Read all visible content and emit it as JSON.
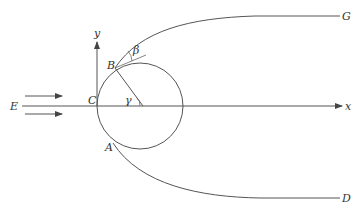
{
  "diagram": {
    "title": "",
    "colors": {
      "stroke": "#555555",
      "text": "#333333",
      "background": "#ffffff"
    },
    "labels": {
      "E": "E",
      "C": "C",
      "B": "B",
      "A": "A",
      "G": "G",
      "D": "D",
      "x": "x",
      "y": "y",
      "beta": "β",
      "gamma": "γ"
    },
    "axes": {
      "x_axis": {
        "label": "x",
        "from": [
          22,
          106
        ],
        "to": [
          342,
          106
        ]
      },
      "y_axis": {
        "label": "y",
        "from": [
          97,
          106
        ],
        "to": [
          97,
          40
        ]
      }
    },
    "circle": {
      "center": [
        140,
        106
      ],
      "radius": 43
    },
    "points": {
      "C": [
        97,
        106
      ],
      "B": [
        115,
        68
      ],
      "A": [
        113,
        143
      ],
      "G": [
        340,
        16
      ],
      "D": [
        340,
        198
      ]
    },
    "flow_arrows": [
      {
        "from": [
          25,
          96
        ],
        "to": [
          62,
          96
        ]
      },
      {
        "from": [
          25,
          114
        ],
        "to": [
          62,
          114
        ]
      }
    ],
    "curves": {
      "upper": "B to G",
      "lower": "A to D"
    }
  }
}
